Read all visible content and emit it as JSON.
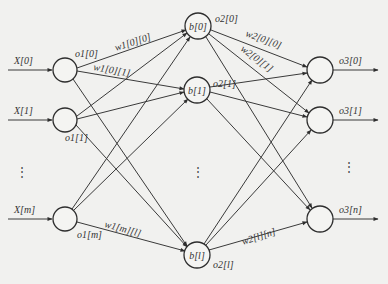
{
  "diagram": {
    "type": "neural-network",
    "layers": {
      "input": {
        "nodes": [
          {
            "id": "in0",
            "x": 65,
            "y": 70,
            "input_label": "X[0]",
            "output_label": "o1[0]"
          },
          {
            "id": "in1",
            "x": 65,
            "y": 120,
            "input_label": "X[1]",
            "output_label": "o1[1]"
          },
          {
            "id": "inm",
            "x": 65,
            "y": 219,
            "input_label": "X[m]",
            "output_label": "o1[m]"
          }
        ]
      },
      "hidden": {
        "nodes": [
          {
            "id": "h0",
            "x": 198,
            "y": 26,
            "label": "b[0]",
            "output_label": "o2[0]"
          },
          {
            "id": "h1",
            "x": 197,
            "y": 90,
            "label": "b[1]",
            "output_label": "o2[1]"
          },
          {
            "id": "hl",
            "x": 197,
            "y": 255,
            "label": "b[l]",
            "output_label": "o2[l]"
          }
        ]
      },
      "output": {
        "nodes": [
          {
            "id": "out0",
            "x": 320,
            "y": 70,
            "output_label": "o3[0]"
          },
          {
            "id": "out1",
            "x": 320,
            "y": 120,
            "output_label": "o3[1]"
          },
          {
            "id": "outn",
            "x": 320,
            "y": 219,
            "output_label": "o3[n]"
          }
        ]
      }
    },
    "weight_labels": {
      "w1_0_0": "w1[0][0]",
      "w1_0_1": "w1[0][1]",
      "w1_m_l": "w1[m][l]",
      "w2_0_0": "w2[0][0]",
      "w2_0_1": "w2[0][1]",
      "w2_l_n": "w2[l][n]"
    },
    "ellipsis": "⋮",
    "colors": {
      "background": "#f1f1ef",
      "stroke": "#2e2e2e",
      "text": "#333333"
    }
  }
}
